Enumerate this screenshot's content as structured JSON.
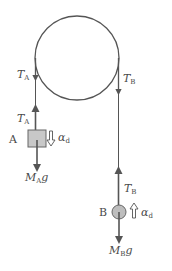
{
  "diagram": {
    "type": "pulley-free-body",
    "colors": {
      "line": "#555555",
      "text": "#4a4a4a",
      "block_fill": "#c8c8c8",
      "ball_fill": "#bdbdbd"
    },
    "pulley": {
      "cx": 77,
      "cy": 58,
      "r": 42
    },
    "labels": {
      "tension_a": {
        "main": "T",
        "sub": "A"
      },
      "tension_b": {
        "main": "T",
        "sub": "B"
      },
      "weight_a": {
        "main": "M",
        "sub": "A",
        "tail": "g"
      },
      "weight_b": {
        "main": "M",
        "sub": "B",
        "tail": "g"
      },
      "accel": {
        "main": "α",
        "sub": "d"
      },
      "body_a": "A",
      "body_b": "B"
    },
    "bodies": [
      {
        "name": "A",
        "shape": "square",
        "accel_direction": "down"
      },
      {
        "name": "B",
        "shape": "circle",
        "accel_direction": "up"
      }
    ]
  }
}
